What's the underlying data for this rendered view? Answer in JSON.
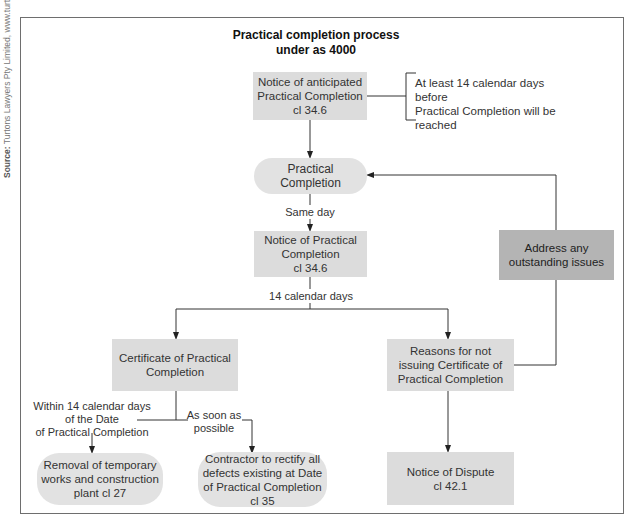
{
  "source": {
    "prefix": "Source:",
    "text": " Turtons Lawyers Pty Limited, www.turtons.com"
  },
  "title": {
    "line1": "Practical completion process",
    "line2": "under as 4000"
  },
  "colors": {
    "box_fill": "#dcdcdc",
    "pill_fill": "#e2e2e2",
    "dark_box_fill": "#b4b4b4",
    "line": "#333333",
    "frame": "#6e6e6e"
  },
  "nodes": {
    "notice_anticipated": {
      "line1": "Notice of anticipated",
      "line2": "Practical Completion",
      "line3": "cl 34.6"
    },
    "note_anticipated": {
      "line1": "At least 14 calendar days before",
      "line2": "Practical Completion will be",
      "line3": "reached"
    },
    "practical_completion": {
      "label": "Practical Completion"
    },
    "notice_pc": {
      "line1": "Notice of Practical",
      "line2": "Completion",
      "line3": "cl 34.6"
    },
    "address_issues": {
      "line1": "Address any",
      "line2": "outstanding issues"
    },
    "certificate": {
      "line1": "Certificate of Practical",
      "line2": "Completion"
    },
    "reasons": {
      "line1": "Reasons for not",
      "line2": "issuing Certificate of",
      "line3": "Practical Completion"
    },
    "removal": {
      "line1": "Removal of temporary",
      "line2": "works and construction",
      "line3": "plant cl 27"
    },
    "contractor": {
      "line1": "Contractor to rectify all",
      "line2": "defects existing at Date",
      "line3": "of Practical Completion",
      "line4": "cl 35"
    },
    "notice_dispute": {
      "line1": "Notice of Dispute",
      "line2": "cl 42.1"
    }
  },
  "edge_labels": {
    "same_day": "Same day",
    "fourteen_days": "14 calendar days",
    "within_14": {
      "line1": "Within 14 calendar days",
      "line2": "of the Date",
      "line3": "of Practical Completion"
    },
    "asap": {
      "line1": "As soon as",
      "line2": "possible"
    }
  }
}
